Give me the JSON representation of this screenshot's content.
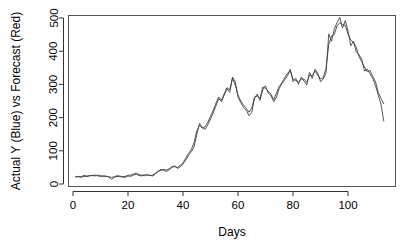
{
  "chart_data": {
    "type": "line",
    "title": "",
    "xlabel": "Days",
    "ylabel": "Actual Y (Blue) vs Forecast (Red)",
    "xlim": [
      0,
      114
    ],
    "ylim": [
      0,
      520
    ],
    "xticks": [
      0,
      20,
      40,
      60,
      80,
      100
    ],
    "yticks": [
      0,
      100,
      200,
      300,
      400,
      500
    ],
    "xtick_labels": [
      "0",
      "20",
      "40",
      "60",
      "80",
      "100"
    ],
    "ytick_labels": [
      "0",
      "100",
      "200",
      "300",
      "400",
      "500"
    ],
    "grid": false,
    "legend": "none",
    "box": true,
    "series": [
      {
        "name": "Actual Y (Blue)",
        "color": "#3a3a3a",
        "x": [
          1,
          2,
          3,
          4,
          5,
          6,
          7,
          8,
          9,
          10,
          11,
          12,
          13,
          14,
          15,
          16,
          17,
          18,
          19,
          20,
          21,
          22,
          23,
          24,
          25,
          26,
          27,
          28,
          29,
          30,
          31,
          32,
          33,
          34,
          35,
          36,
          37,
          38,
          39,
          40,
          41,
          42,
          43,
          44,
          45,
          46,
          47,
          48,
          49,
          50,
          51,
          52,
          53,
          54,
          55,
          56,
          57,
          58,
          59,
          60,
          61,
          62,
          63,
          64,
          65,
          66,
          67,
          68,
          69,
          70,
          71,
          72,
          73,
          74,
          75,
          76,
          77,
          78,
          79,
          80,
          81,
          82,
          83,
          84,
          85,
          86,
          87,
          88,
          89,
          90,
          91,
          92,
          93,
          94,
          95,
          96,
          97,
          98,
          99,
          100,
          101,
          102,
          103,
          104,
          105,
          106,
          107,
          108,
          109,
          110,
          111,
          112,
          113
        ],
        "values": [
          21,
          22,
          20,
          23,
          22,
          24,
          26,
          24,
          27,
          25,
          22,
          24,
          21,
          14,
          20,
          23,
          22,
          21,
          20,
          24,
          23,
          27,
          29,
          26,
          24,
          28,
          27,
          26,
          24,
          30,
          39,
          44,
          41,
          38,
          43,
          50,
          55,
          47,
          52,
          60,
          72,
          86,
          98,
          112,
          148,
          183,
          171,
          164,
          178,
          196,
          214,
          236,
          257,
          248,
          268,
          287,
          276,
          322,
          308,
          262,
          245,
          230,
          222,
          206,
          216,
          258,
          271,
          252,
          284,
          296,
          274,
          266,
          248,
          262,
          288,
          302,
          314,
          326,
          346,
          308,
          318,
          300,
          322,
          310,
          298,
          336,
          318,
          346,
          334,
          308,
          316,
          334,
          452,
          430,
          466,
          486,
          502,
          470,
          492,
          462,
          416,
          430,
          398,
          390,
          376,
          340,
          346,
          332,
          318,
          296,
          268,
          240,
          190
        ]
      },
      {
        "name": "Forecast (Red)",
        "color": "#3a3a3a",
        "x": [
          1,
          2,
          3,
          4,
          5,
          6,
          7,
          8,
          9,
          10,
          11,
          12,
          13,
          14,
          15,
          16,
          17,
          18,
          19,
          20,
          21,
          22,
          23,
          24,
          25,
          26,
          27,
          28,
          29,
          30,
          31,
          32,
          33,
          34,
          35,
          36,
          37,
          38,
          39,
          40,
          41,
          42,
          43,
          44,
          45,
          46,
          47,
          48,
          49,
          50,
          51,
          52,
          53,
          54,
          55,
          56,
          57,
          58,
          59,
          60,
          61,
          62,
          63,
          64,
          65,
          66,
          67,
          68,
          69,
          70,
          71,
          72,
          73,
          74,
          75,
          76,
          77,
          78,
          79,
          80,
          81,
          82,
          83,
          84,
          85,
          86,
          87,
          88,
          89,
          90,
          91,
          92,
          93,
          94,
          95,
          96,
          97,
          98,
          99,
          100,
          101,
          102,
          103,
          104,
          105,
          106,
          107,
          108,
          109,
          110,
          111,
          112,
          113
        ],
        "values": [
          22,
          23,
          22,
          26,
          24,
          26,
          25,
          27,
          24,
          23,
          25,
          23,
          22,
          20,
          22,
          25,
          24,
          22,
          23,
          26,
          27,
          30,
          33,
          28,
          27,
          25,
          28,
          25,
          27,
          33,
          38,
          41,
          44,
          42,
          46,
          52,
          52,
          50,
          56,
          64,
          78,
          92,
          104,
          124,
          160,
          176,
          168,
          172,
          186,
          204,
          222,
          244,
          262,
          252,
          272,
          290,
          284,
          318,
          298,
          268,
          250,
          238,
          228,
          216,
          228,
          262,
          265,
          258,
          292,
          288,
          280,
          270,
          254,
          274,
          294,
          306,
          320,
          334,
          340,
          316,
          312,
          308,
          316,
          316,
          306,
          328,
          326,
          340,
          328,
          316,
          320,
          348,
          420,
          446,
          450,
          476,
          486,
          480,
          478,
          452,
          434,
          426,
          412,
          384,
          368,
          352,
          338,
          342,
          324,
          308,
          276,
          258,
          242
        ]
      }
    ]
  },
  "figure": {
    "background": "#ffffff",
    "box_color": "#555555",
    "axis_color": "#333333"
  }
}
